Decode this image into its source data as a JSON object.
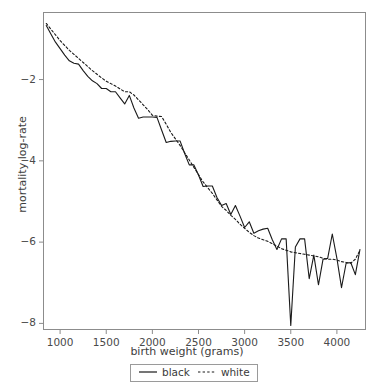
{
  "chart_data": {
    "type": "line",
    "title": "",
    "xlabel": "birth weight (grams)",
    "ylabel": "mortality log-rate",
    "xlim": [
      820,
      4310
    ],
    "ylim": [
      -8.15,
      -0.35
    ],
    "xticks": [
      1000,
      1500,
      2000,
      2500,
      3000,
      3500,
      4000
    ],
    "xtick_labels": [
      "1000",
      "1500",
      "2000",
      "2500",
      "3000",
      "3500",
      "4000"
    ],
    "yticks": [
      -2,
      -4,
      -6,
      -8
    ],
    "ytick_labels": [
      "−2",
      "−4",
      "−6",
      "−8"
    ],
    "grid": false,
    "legend_position": "below-axis-center",
    "series": [
      {
        "name": "black",
        "style": "solid",
        "color": "#1a1a1a",
        "x": [
          850,
          900,
          950,
          1000,
          1050,
          1100,
          1150,
          1200,
          1250,
          1300,
          1350,
          1400,
          1450,
          1500,
          1550,
          1600,
          1650,
          1700,
          1750,
          1800,
          1850,
          1900,
          1950,
          2000,
          2050,
          2100,
          2150,
          2200,
          2250,
          2300,
          2350,
          2400,
          2450,
          2500,
          2550,
          2600,
          2650,
          2700,
          2750,
          2800,
          2850,
          2900,
          2950,
          3000,
          3050,
          3100,
          3150,
          3200,
          3250,
          3300,
          3350,
          3400,
          3450,
          3500,
          3550,
          3600,
          3650,
          3700,
          3750,
          3800,
          3850,
          3900,
          3950,
          4000,
          4050,
          4100,
          4150,
          4200,
          4250
        ],
        "y": [
          -0.67,
          -0.88,
          -1.08,
          -1.24,
          -1.4,
          -1.54,
          -1.6,
          -1.62,
          -1.78,
          -1.92,
          -2.03,
          -2.1,
          -2.22,
          -2.22,
          -2.3,
          -2.3,
          -2.45,
          -2.6,
          -2.39,
          -2.7,
          -2.95,
          -2.92,
          -2.92,
          -2.92,
          -2.93,
          -3.24,
          -3.55,
          -3.52,
          -3.51,
          -3.51,
          -3.82,
          -4.1,
          -4.1,
          -4.35,
          -4.63,
          -4.62,
          -4.62,
          -4.9,
          -5.1,
          -5.05,
          -5.32,
          -5.1,
          -5.36,
          -5.64,
          -5.5,
          -5.78,
          -5.72,
          -5.68,
          -5.66,
          -5.94,
          -6.18,
          -5.92,
          -5.92,
          -8.05,
          -6.12,
          -5.92,
          -5.92,
          -6.9,
          -6.32,
          -7.05,
          -6.42,
          -6.4,
          -5.8,
          -6.4,
          -7.12,
          -6.52,
          -6.5,
          -6.8,
          -6.18
        ]
      },
      {
        "name": "white",
        "style": "dashed",
        "color": "#1a1a1a",
        "x": [
          850,
          900,
          950,
          1000,
          1050,
          1100,
          1150,
          1200,
          1250,
          1300,
          1350,
          1400,
          1450,
          1500,
          1550,
          1600,
          1650,
          1700,
          1750,
          1800,
          1850,
          1900,
          1950,
          2000,
          2050,
          2100,
          2150,
          2200,
          2250,
          2300,
          2350,
          2400,
          2450,
          2500,
          2550,
          2600,
          2650,
          2700,
          2750,
          2800,
          2850,
          2900,
          2950,
          3000,
          3050,
          3100,
          3150,
          3200,
          3250,
          3300,
          3350,
          3400,
          3450,
          3500,
          3550,
          3600,
          3650,
          3700,
          3750,
          3800,
          3850,
          3900,
          3950,
          4000,
          4050,
          4100,
          4150,
          4200,
          4250
        ],
        "y": [
          -0.62,
          -0.76,
          -0.9,
          -1.04,
          -1.16,
          -1.28,
          -1.38,
          -1.48,
          -1.58,
          -1.68,
          -1.78,
          -1.87,
          -1.96,
          -2.04,
          -2.1,
          -2.16,
          -2.23,
          -2.3,
          -2.3,
          -2.38,
          -2.5,
          -2.62,
          -2.74,
          -2.88,
          -2.9,
          -2.91,
          -3.1,
          -3.3,
          -3.46,
          -3.62,
          -3.8,
          -3.98,
          -4.16,
          -4.34,
          -4.52,
          -4.66,
          -4.8,
          -4.96,
          -5.12,
          -5.22,
          -5.34,
          -5.44,
          -5.56,
          -5.66,
          -5.76,
          -5.84,
          -5.9,
          -5.94,
          -5.98,
          -6.04,
          -6.1,
          -6.16,
          -6.2,
          -6.24,
          -6.26,
          -6.28,
          -6.3,
          -6.32,
          -6.34,
          -6.36,
          -6.4,
          -6.42,
          -6.42,
          -6.44,
          -6.48,
          -6.5,
          -6.52,
          -6.42,
          -6.2
        ]
      }
    ]
  },
  "legend": {
    "entries": [
      {
        "label": "black",
        "style": "solid"
      },
      {
        "label": "white",
        "style": "dashed"
      }
    ]
  }
}
